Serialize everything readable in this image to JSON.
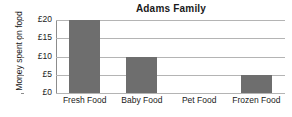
{
  "chart_data": {
    "type": "bar",
    "title": "Adams Family",
    "xlabel": "",
    "ylabel": "Money spent on food",
    "categories": [
      "Fresh Food",
      "Baby Food",
      "Pet Food",
      "Frozen Food"
    ],
    "values": [
      20,
      10,
      0,
      5
    ],
    "value_prefix": "£",
    "ylim": [
      0,
      20
    ],
    "ytick_values": [
      0,
      5,
      10,
      15,
      20
    ],
    "ytick_labels": [
      "£0",
      "£5",
      "£10",
      "£15",
      "£20"
    ],
    "grid": true,
    "legend": false,
    "colors": {
      "bar_fill": "#6e6e6e",
      "gridline": "#b4b4b4",
      "axis": "#777777",
      "background": "#ffffff",
      "text": "#1a1a1a"
    }
  }
}
